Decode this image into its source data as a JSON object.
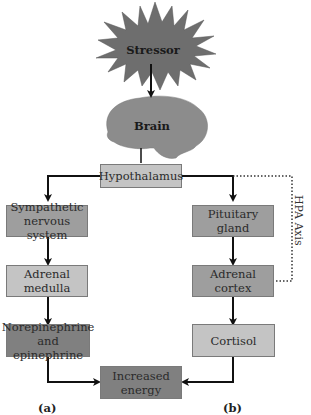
{
  "diagram": {
    "stressor": "Stressor",
    "brain": "Brain",
    "hypothalamus": "Hypothalamus",
    "path_a": {
      "label": "(a)",
      "nodes": [
        "Sympathetic nervous system",
        "Adrenal medulla",
        "Norepinephrine and epinephrine"
      ],
      "sympathetic_line1": "Sympathetic",
      "sympathetic_line2": "nervous system",
      "medulla_line1": "Adrenal",
      "medulla_line2": "medulla",
      "norepi_line1": "Norepinephrine",
      "norepi_line2": "and epinephrine"
    },
    "path_b": {
      "label": "(b)",
      "nodes": [
        "Pituitary gland",
        "Adrenal cortex",
        "Cortisol"
      ],
      "pituitary_line1": "Pituitary",
      "pituitary_line2": "gland",
      "cortex_line1": "Adrenal",
      "cortex_line2": "cortex",
      "cortisol": "Cortisol"
    },
    "outcome_line1": "Increased",
    "outcome_line2": "energy",
    "hpa_axis_label": "HPA Axis",
    "colors": {
      "stressor_fill": "#6e6e6e",
      "brain_fill": "#8c8c8c",
      "light_box": "#c4c4c4",
      "mid_box": "#9e9e9e",
      "dark_box": "#808080"
    }
  }
}
